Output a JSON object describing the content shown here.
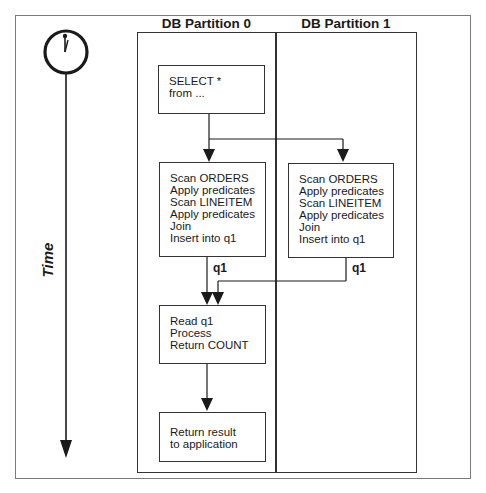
{
  "timeline": {
    "label": "Time",
    "icon": "clock-icon"
  },
  "partitions": [
    {
      "title": "DB Partition 0"
    },
    {
      "title": "DB Partition 1"
    }
  ],
  "steps": {
    "select": "SELECT *\nfrom ...",
    "scan_p0": "Scan ORDERS\nApply predicates\nScan LINEITEM\nApply predicates\nJoin\nInsert into q1",
    "scan_p1": "Scan ORDERS\nApply predicates\nScan LINEITEM\nApply predicates\nJoin\nInsert into q1",
    "read": "Read q1\nProcess\nReturn COUNT",
    "return": "Return result\nto application"
  },
  "flow_labels": {
    "q1_p0": "q1",
    "q1_p1": "q1"
  },
  "colors": {
    "line": "#1a1a1a",
    "frame": "#7a7a7a",
    "background": "#ffffff"
  }
}
